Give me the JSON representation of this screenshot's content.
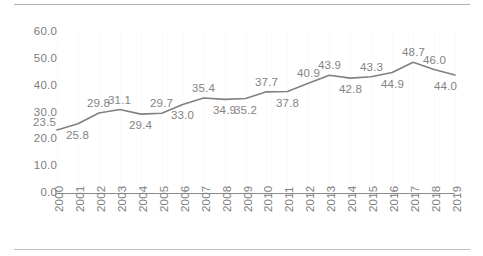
{
  "chart_data": {
    "type": "line",
    "title": "",
    "subtitle": "",
    "xlabel": "",
    "ylabel": "",
    "categories": [
      "2000",
      "2001",
      "2002",
      "2003",
      "2004",
      "2005",
      "2006",
      "2007",
      "2008",
      "2009",
      "2010",
      "2011",
      "2012",
      "2013",
      "2014",
      "2015",
      "2016",
      "2017",
      "2018",
      "2019"
    ],
    "values": [
      23.5,
      25.8,
      29.8,
      31.1,
      29.4,
      29.7,
      33.0,
      35.4,
      34.9,
      35.2,
      37.7,
      37.8,
      40.9,
      43.9,
      42.8,
      43.3,
      44.9,
      48.7,
      46.0,
      44.0
    ],
    "point_labels": [
      "23.5",
      "25.8",
      "29.8",
      "31.1",
      "29.4",
      "29.7",
      "33.0",
      "35.4",
      "34.9",
      "35.2",
      "37.7",
      "37.8",
      "40.9",
      "43.9",
      "42.8",
      "43.3",
      "44.9",
      "48.7",
      "46.0",
      "44.0"
    ],
    "ylim": [
      0,
      60
    ],
    "ytick_labels": [
      "60.0",
      "50.0",
      "40.0",
      "30.0",
      "20.0",
      "10.0",
      "0.0"
    ],
    "ytick_values": [
      60,
      50,
      40,
      30,
      20,
      10,
      0
    ],
    "grid": "vertical-faint",
    "legend": "none",
    "series": [
      {
        "name": "",
        "color": "#808080",
        "values": [
          23.5,
          25.8,
          29.8,
          31.1,
          29.4,
          29.7,
          33.0,
          35.4,
          34.9,
          35.2,
          37.7,
          37.8,
          40.9,
          43.9,
          42.8,
          43.3,
          44.9,
          48.7,
          46.0,
          44.0
        ]
      }
    ]
  },
  "style": {
    "line_color": "#808080",
    "text_color": "#7d7d7d",
    "axis_color": "#8c8c8c",
    "rule_color": "#b0b0b0",
    "grid_color": "#fafafa",
    "background": "#ffffff"
  },
  "label_placement": [
    "above-left",
    "below",
    "above",
    "above",
    "below",
    "above",
    "below",
    "above",
    "below",
    "below",
    "above",
    "below",
    "above",
    "above",
    "below",
    "above",
    "below",
    "above",
    "above",
    "below-right"
  ]
}
